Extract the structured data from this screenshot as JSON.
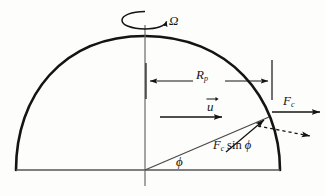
{
  "figure": {
    "type": "physics-diagram",
    "background_color": "#fdfdfc",
    "ink_color": "#141414"
  },
  "labels": {
    "omega": "Ω",
    "radius_symbol": "R",
    "radius_subscript": "p",
    "velocity": "u",
    "force": "F",
    "force_subscript": "c",
    "force_component_prefix": "F",
    "force_component_subscript": "c",
    "force_component_function": "sin",
    "angle": "ϕ"
  },
  "geometry": {
    "center_x": 145,
    "baseline_y": 170,
    "apex_y": 36,
    "left_edge_x": 16,
    "right_edge_x": 280,
    "axis_top_y": 25,
    "axis_bottom_y": 186,
    "dimension_line_y": 81,
    "dimension_tick_x": 272,
    "velocity_arrow_y": 117,
    "surface_point_x": 268,
    "surface_point_y": 118,
    "angle_degrees": 23
  },
  "elements": {
    "hemisphere_arc": "hemisphere outline arc",
    "baseline": "equatorial base line",
    "rotation_axis": "vertical rotation axis",
    "rotation_ellipse": "spin indicator ellipse",
    "radius_dimension": "R_p double headed dimension arrow",
    "velocity_vector": "u velocity arrow",
    "coriolis_force_vector": "F_c horizontal force arrow",
    "force_component_vector": "F_c sin phi radial component arrow",
    "dashed_projection": "dashed projection arrow",
    "angle_marker": "phi latitude angle"
  }
}
